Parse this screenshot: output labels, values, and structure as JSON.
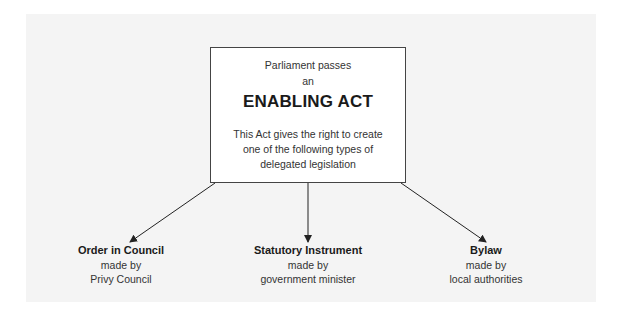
{
  "diagram": {
    "main_box": {
      "line1": "Parliament passes",
      "line2": "an",
      "title": "ENABLING ACT",
      "desc": [
        "This Act gives the right to create",
        "one of the following types of",
        "delegated legislation"
      ]
    },
    "leaves": [
      {
        "name": "Order in Council",
        "made_by": "made by",
        "maker": "Privy Council"
      },
      {
        "name": "Statutory Instrument",
        "made_by": "made by",
        "maker": "government minister"
      },
      {
        "name": "Bylaw",
        "made_by": "made by",
        "maker": "local authorities"
      }
    ],
    "colors": {
      "panel": "#f4f4f4",
      "box_border": "#444444",
      "arrow": "#222222"
    }
  }
}
